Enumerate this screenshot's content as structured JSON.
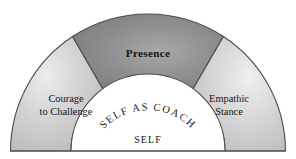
{
  "diagram": {
    "title": "Self as Coach",
    "type": "semicircular-sector-diagram",
    "center_label": "SELF",
    "arc_label": "SELF AS COACH",
    "sectors": [
      {
        "id": "courage-to-challenge",
        "label_line1": "Courage",
        "label_line2": "to Challenge",
        "fill": "#c9c9c9",
        "position": "left"
      },
      {
        "id": "presence",
        "label_line1": "Presence",
        "label_line2": "",
        "fill": "#8b8b8b",
        "position": "center"
      },
      {
        "id": "empathic-stance",
        "label_line1": "Empathic",
        "label_line2": "Stance",
        "fill": "#c9c9c9",
        "position": "right"
      }
    ],
    "colors": {
      "outline": "#4a4a4a",
      "inner_fill": "#ffffff",
      "text": "#141414",
      "background": "#ffffff",
      "highlight": "#e4e4e4",
      "presence_highlight": "#a6a6a6"
    }
  }
}
